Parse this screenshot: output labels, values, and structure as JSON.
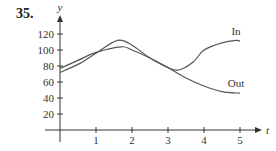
{
  "problem_number": "35.",
  "chart_data": {
    "type": "line",
    "title": "",
    "xlabel": "t",
    "ylabel": "y",
    "xlim": [
      0,
      5
    ],
    "ylim": [
      0,
      120
    ],
    "x_ticks": [
      "1",
      "2",
      "3",
      "4",
      "5"
    ],
    "y_ticks": [
      "20",
      "40",
      "60",
      "80",
      "100",
      "120"
    ],
    "grid": false,
    "legend": "inline labels at right end of curves",
    "series": [
      {
        "name": "In",
        "x": [
          0,
          0.5,
          1,
          1.6,
          2,
          2.5,
          3,
          3.3,
          3.7,
          4,
          4.5,
          4.9,
          5
        ],
        "values": [
          72,
          82,
          96,
          112,
          106,
          90,
          78,
          75,
          85,
          100,
          109,
          112,
          111
        ]
      },
      {
        "name": "Out",
        "x": [
          0,
          0.5,
          1,
          1.7,
          2,
          2.5,
          3,
          3.5,
          4,
          4.5,
          5
        ],
        "values": [
          77,
          87,
          97,
          104,
          100,
          90,
          78,
          65,
          55,
          48,
          46
        ]
      }
    ]
  },
  "colors": {
    "curve": "#555555",
    "axis": "#333333"
  }
}
